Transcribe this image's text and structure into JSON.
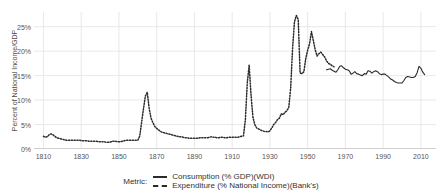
{
  "axes": {
    "ylabel": "Percent of National Income/GDP",
    "yticks": [
      {
        "value": 0,
        "label": "0%"
      },
      {
        "value": 5,
        "label": "5%"
      },
      {
        "value": 10,
        "label": "10%"
      },
      {
        "value": 15,
        "label": "15%"
      },
      {
        "value": 20,
        "label": "20%"
      },
      {
        "value": 25,
        "label": "25%"
      }
    ],
    "xticks": [
      {
        "value": 1810,
        "label": "1810"
      },
      {
        "value": 1830,
        "label": "1830"
      },
      {
        "value": 1850,
        "label": "1850"
      },
      {
        "value": 1870,
        "label": "1870"
      },
      {
        "value": 1890,
        "label": "1890"
      },
      {
        "value": 1910,
        "label": "1910"
      },
      {
        "value": 1930,
        "label": "1930"
      },
      {
        "value": 1950,
        "label": "1950"
      },
      {
        "value": 1970,
        "label": "1970"
      },
      {
        "value": 1990,
        "label": "1990"
      },
      {
        "value": 2010,
        "label": "2010"
      }
    ]
  },
  "legend": {
    "title": "Metric:",
    "entries": [
      {
        "label": "Consumption (% GDP)(WDI)",
        "style": "solid",
        "color": "#2b2b2b"
      },
      {
        "label": "Expenditure (% National Income)(Bank's)",
        "style": "dashed",
        "color": "#2b2b2b"
      }
    ]
  },
  "chart_data": {
    "type": "line",
    "title": "",
    "xlabel": "",
    "ylabel": "Percent of National Income/GDP",
    "xlim": [
      1805,
      2018
    ],
    "ylim": [
      0,
      28
    ],
    "grid": true,
    "legend_position": "bottom",
    "series": [
      {
        "name": "Expenditure (% National Income)(Bank's)",
        "style": "dashed",
        "color": "#2b2b2b",
        "points": [
          [
            1810,
            2.6
          ],
          [
            1811,
            2.4
          ],
          [
            1812,
            2.5
          ],
          [
            1813,
            2.9
          ],
          [
            1814,
            3.1
          ],
          [
            1815,
            2.9
          ],
          [
            1816,
            2.6
          ],
          [
            1817,
            2.3
          ],
          [
            1818,
            2.2
          ],
          [
            1819,
            2.1
          ],
          [
            1820,
            2.0
          ],
          [
            1821,
            1.9
          ],
          [
            1822,
            1.8
          ],
          [
            1823,
            1.8
          ],
          [
            1824,
            1.8
          ],
          [
            1825,
            1.8
          ],
          [
            1826,
            1.8
          ],
          [
            1827,
            1.8
          ],
          [
            1828,
            1.8
          ],
          [
            1829,
            1.8
          ],
          [
            1830,
            1.7
          ],
          [
            1831,
            1.7
          ],
          [
            1832,
            1.7
          ],
          [
            1833,
            1.7
          ],
          [
            1834,
            1.6
          ],
          [
            1835,
            1.6
          ],
          [
            1836,
            1.6
          ],
          [
            1837,
            1.6
          ],
          [
            1838,
            1.6
          ],
          [
            1839,
            1.5
          ],
          [
            1840,
            1.5
          ],
          [
            1841,
            1.5
          ],
          [
            1842,
            1.5
          ],
          [
            1843,
            1.4
          ],
          [
            1844,
            1.4
          ],
          [
            1845,
            1.4
          ],
          [
            1846,
            1.5
          ],
          [
            1847,
            1.6
          ],
          [
            1848,
            1.6
          ],
          [
            1849,
            1.5
          ],
          [
            1850,
            1.5
          ],
          [
            1851,
            1.5
          ],
          [
            1852,
            1.6
          ],
          [
            1853,
            1.7
          ],
          [
            1854,
            1.8
          ],
          [
            1855,
            1.8
          ],
          [
            1856,
            1.8
          ],
          [
            1857,
            1.8
          ],
          [
            1858,
            1.8
          ],
          [
            1859,
            1.8
          ],
          [
            1860,
            1.8
          ],
          [
            1861,
            2.6
          ],
          [
            1862,
            5.4
          ],
          [
            1863,
            8.2
          ],
          [
            1864,
            10.8
          ],
          [
            1865,
            11.6
          ],
          [
            1866,
            8.4
          ],
          [
            1867,
            6.3
          ],
          [
            1868,
            5.4
          ],
          [
            1869,
            4.6
          ],
          [
            1870,
            4.2
          ],
          [
            1871,
            3.9
          ],
          [
            1872,
            3.6
          ],
          [
            1873,
            3.4
          ],
          [
            1874,
            3.3
          ],
          [
            1875,
            3.2
          ],
          [
            1876,
            3.1
          ],
          [
            1877,
            3.0
          ],
          [
            1878,
            2.9
          ],
          [
            1879,
            2.8
          ],
          [
            1880,
            2.7
          ],
          [
            1881,
            2.6
          ],
          [
            1882,
            2.5
          ],
          [
            1883,
            2.5
          ],
          [
            1884,
            2.4
          ],
          [
            1885,
            2.3
          ],
          [
            1886,
            2.3
          ],
          [
            1887,
            2.2
          ],
          [
            1888,
            2.2
          ],
          [
            1889,
            2.2
          ],
          [
            1890,
            2.2
          ],
          [
            1891,
            2.2
          ],
          [
            1892,
            2.2
          ],
          [
            1893,
            2.3
          ],
          [
            1894,
            2.3
          ],
          [
            1895,
            2.3
          ],
          [
            1896,
            2.3
          ],
          [
            1897,
            2.3
          ],
          [
            1898,
            2.4
          ],
          [
            1899,
            2.5
          ],
          [
            1900,
            2.4
          ],
          [
            1901,
            2.4
          ],
          [
            1902,
            2.3
          ],
          [
            1903,
            2.3
          ],
          [
            1904,
            2.4
          ],
          [
            1905,
            2.4
          ],
          [
            1906,
            2.3
          ],
          [
            1907,
            2.3
          ],
          [
            1908,
            2.4
          ],
          [
            1909,
            2.4
          ],
          [
            1910,
            2.4
          ],
          [
            1911,
            2.4
          ],
          [
            1912,
            2.4
          ],
          [
            1913,
            2.4
          ],
          [
            1914,
            2.5
          ],
          [
            1915,
            2.6
          ],
          [
            1916,
            2.7
          ],
          [
            1917,
            6.0
          ],
          [
            1918,
            13.5
          ],
          [
            1919,
            17.2
          ],
          [
            1920,
            11.0
          ],
          [
            1921,
            6.5
          ],
          [
            1922,
            5.0
          ],
          [
            1923,
            4.3
          ],
          [
            1924,
            4.1
          ],
          [
            1925,
            3.9
          ],
          [
            1926,
            3.7
          ],
          [
            1927,
            3.6
          ],
          [
            1928,
            3.6
          ],
          [
            1929,
            3.5
          ],
          [
            1930,
            3.7
          ],
          [
            1931,
            4.3
          ],
          [
            1932,
            5.0
          ],
          [
            1933,
            5.4
          ],
          [
            1934,
            6.0
          ],
          [
            1935,
            6.3
          ],
          [
            1936,
            7.2
          ],
          [
            1937,
            7.0
          ],
          [
            1938,
            7.5
          ],
          [
            1939,
            7.8
          ],
          [
            1940,
            8.5
          ],
          [
            1941,
            12.5
          ],
          [
            1942,
            20.5
          ],
          [
            1943,
            26.0
          ],
          [
            1944,
            27.3
          ],
          [
            1945,
            26.5
          ],
          [
            1946,
            15.5
          ],
          [
            1947,
            15.4
          ],
          [
            1948,
            15.8
          ],
          [
            1949,
            18.5
          ],
          [
            1950,
            20.2
          ],
          [
            1951,
            21.5
          ],
          [
            1952,
            24.0
          ],
          [
            1953,
            22.2
          ],
          [
            1954,
            20.3
          ],
          [
            1955,
            19.0
          ],
          [
            1956,
            19.5
          ],
          [
            1957,
            19.8
          ],
          [
            1958,
            19.3
          ],
          [
            1959,
            18.8
          ],
          [
            1960,
            18.0
          ],
          [
            1961,
            17.5
          ],
          [
            1962,
            17.3
          ],
          [
            1963,
            17.0
          ],
          [
            1964,
            16.8
          ]
        ]
      },
      {
        "name": "Consumption (% GDP)(WDI)",
        "style": "solid",
        "color": "#2b2b2b",
        "points": [
          [
            1960,
            16.2
          ],
          [
            1961,
            16.3
          ],
          [
            1962,
            16.4
          ],
          [
            1963,
            16.1
          ],
          [
            1964,
            15.9
          ],
          [
            1965,
            15.7
          ],
          [
            1966,
            16.2
          ],
          [
            1967,
            16.9
          ],
          [
            1968,
            17.0
          ],
          [
            1969,
            16.6
          ],
          [
            1970,
            16.3
          ],
          [
            1971,
            16.2
          ],
          [
            1972,
            16.0
          ],
          [
            1973,
            15.3
          ],
          [
            1974,
            15.5
          ],
          [
            1975,
            15.8
          ],
          [
            1976,
            15.4
          ],
          [
            1977,
            15.3
          ],
          [
            1978,
            15.1
          ],
          [
            1979,
            15.0
          ],
          [
            1980,
            15.4
          ],
          [
            1981,
            15.3
          ],
          [
            1982,
            16.0
          ],
          [
            1983,
            15.9
          ],
          [
            1984,
            15.5
          ],
          [
            1985,
            15.8
          ],
          [
            1986,
            16.0
          ],
          [
            1987,
            15.8
          ],
          [
            1988,
            15.4
          ],
          [
            1989,
            15.2
          ],
          [
            1990,
            15.3
          ],
          [
            1991,
            15.3
          ],
          [
            1992,
            15.0
          ],
          [
            1993,
            14.7
          ],
          [
            1994,
            14.3
          ],
          [
            1995,
            14.1
          ],
          [
            1996,
            13.8
          ],
          [
            1997,
            13.6
          ],
          [
            1998,
            13.5
          ],
          [
            1999,
            13.5
          ],
          [
            2000,
            13.5
          ],
          [
            2001,
            14.0
          ],
          [
            2002,
            14.6
          ],
          [
            2003,
            14.8
          ],
          [
            2004,
            14.7
          ],
          [
            2005,
            14.6
          ],
          [
            2006,
            14.6
          ],
          [
            2007,
            14.8
          ],
          [
            2008,
            15.6
          ],
          [
            2009,
            16.9
          ],
          [
            2010,
            16.5
          ],
          [
            2011,
            15.7
          ],
          [
            2012,
            15.2
          ]
        ]
      }
    ]
  }
}
